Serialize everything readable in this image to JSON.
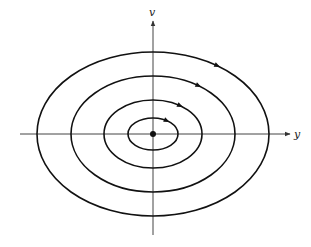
{
  "diagram": {
    "type": "phase-portrait",
    "axes": {
      "horizontal_label": "y",
      "vertical_label": "v"
    },
    "center_point": {
      "x": 153,
      "y": 134
    },
    "orbits": [
      {
        "rx": 25,
        "ry": 16,
        "direction": "clockwise"
      },
      {
        "rx": 49,
        "ry": 34,
        "direction": "clockwise"
      },
      {
        "rx": 82,
        "ry": 58,
        "direction": "clockwise"
      },
      {
        "rx": 116,
        "ry": 82,
        "direction": "clockwise"
      }
    ],
    "colors": {
      "stroke": "#111111",
      "axis": "#444444",
      "background": "#ffffff"
    }
  }
}
